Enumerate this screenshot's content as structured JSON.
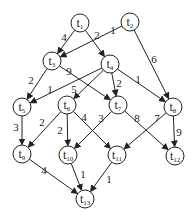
{
  "diagram": {
    "type": "weighted-directed-graph",
    "node_radius": 9,
    "colors": {
      "stroke": "#222222",
      "fill": "#ffffff",
      "background": "#ffffff"
    },
    "nodes": [
      {
        "id": "t1",
        "base": "t",
        "sub": "1",
        "x": 80,
        "y": 23
      },
      {
        "id": "t2",
        "base": "t",
        "sub": "2",
        "x": 130,
        "y": 22
      },
      {
        "id": "t3",
        "base": "t",
        "sub": "3",
        "x": 52,
        "y": 61
      },
      {
        "id": "t4",
        "base": "t",
        "sub": "4",
        "x": 110,
        "y": 64
      },
      {
        "id": "t5",
        "base": "t",
        "sub": "5",
        "x": 22,
        "y": 107
      },
      {
        "id": "t6",
        "base": "t",
        "sub": "6",
        "x": 67,
        "y": 105
      },
      {
        "id": "t7",
        "base": "t",
        "sub": "7",
        "x": 118,
        "y": 105
      },
      {
        "id": "t8",
        "base": "t",
        "sub": "8",
        "x": 173,
        "y": 107
      },
      {
        "id": "t9",
        "base": "t",
        "sub": "9",
        "x": 22,
        "y": 154
      },
      {
        "id": "t10",
        "base": "t",
        "sub": "10",
        "x": 68,
        "y": 155
      },
      {
        "id": "t11",
        "base": "t",
        "sub": "11",
        "x": 117,
        "y": 155
      },
      {
        "id": "t12",
        "base": "t",
        "sub": "12",
        "x": 175,
        "y": 156
      },
      {
        "id": "t13",
        "base": "t",
        "sub": "13",
        "x": 85,
        "y": 199
      }
    ],
    "edges": [
      {
        "from": "t1",
        "to": "t3",
        "weight": "4",
        "lx": 64,
        "ly": 41
      },
      {
        "from": "t1",
        "to": "t4",
        "weight": "2",
        "lx": 97,
        "ly": 39
      },
      {
        "from": "t2",
        "to": "t3",
        "weight": "1",
        "lx": 113,
        "ly": 34
      },
      {
        "from": "t2",
        "to": "t8",
        "weight": "6",
        "lx": 154,
        "ly": 63
      },
      {
        "from": "t3",
        "to": "t5",
        "weight": "2",
        "lx": 31,
        "ly": 84
      },
      {
        "from": "t3",
        "to": "t7",
        "weight": "9",
        "lx": 69,
        "ly": 75
      },
      {
        "from": "t4",
        "to": "t5",
        "weight": "1",
        "lx": 50,
        "ly": 93
      },
      {
        "from": "t4",
        "to": "t6",
        "weight": "5",
        "lx": 74,
        "ly": 93
      },
      {
        "from": "t4",
        "to": "t7",
        "weight": "2",
        "lx": 119,
        "ly": 87
      },
      {
        "from": "t4",
        "to": "t8",
        "weight": "1",
        "lx": 138,
        "ly": 83
      },
      {
        "from": "t5",
        "to": "t9",
        "weight": "3",
        "lx": 16,
        "ly": 131
      },
      {
        "from": "t6",
        "to": "t9",
        "weight": "2",
        "lx": 42,
        "ly": 126
      },
      {
        "from": "t6",
        "to": "t10",
        "weight": "2",
        "lx": 60,
        "ly": 134
      },
      {
        "from": "t6",
        "to": "t11",
        "weight": "4",
        "lx": 84,
        "ly": 121
      },
      {
        "from": "t7",
        "to": "t10",
        "weight": "3",
        "lx": 101,
        "ly": 122
      },
      {
        "from": "t7",
        "to": "t12",
        "weight": "8",
        "lx": 137,
        "ly": 122
      },
      {
        "from": "t8",
        "to": "t11",
        "weight": "7",
        "lx": 157,
        "ly": 122
      },
      {
        "from": "t8",
        "to": "t12",
        "weight": "9",
        "lx": 179,
        "ly": 136
      },
      {
        "from": "t9",
        "to": "t13",
        "weight": "4",
        "lx": 44,
        "ly": 174
      },
      {
        "from": "t10",
        "to": "t13",
        "weight": "1",
        "lx": 83,
        "ly": 178
      },
      {
        "from": "t11",
        "to": "t13",
        "weight": "1",
        "lx": 109,
        "ly": 183
      }
    ]
  }
}
